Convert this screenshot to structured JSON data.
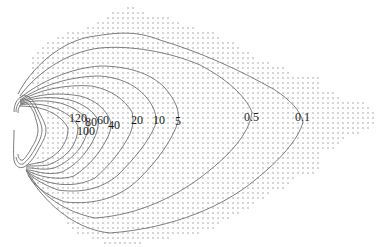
{
  "figure": {
    "dot_color": "#8a8a8a",
    "line_color": "#6e6e6e",
    "dot_spacing": 5
  },
  "contour_labels": [
    {
      "id": "120",
      "text": "120",
      "x": 69,
      "y": 112
    },
    {
      "id": "100",
      "text": "100",
      "x": 77,
      "y": 125
    },
    {
      "id": "80",
      "text": "80",
      "x": 85,
      "y": 116
    },
    {
      "id": "60",
      "text": "60",
      "x": 97,
      "y": 114
    },
    {
      "id": "40",
      "text": "40",
      "x": 108,
      "y": 119
    },
    {
      "id": "20",
      "text": "20",
      "x": 131,
      "y": 114
    },
    {
      "id": "10",
      "text": "10",
      "x": 153,
      "y": 114
    },
    {
      "id": "5",
      "text": "5",
      "x": 175,
      "y": 115
    },
    {
      "id": "0.5",
      "text": "0.5",
      "x": 244,
      "y": 111
    },
    {
      "id": "0.1",
      "text": "0.1",
      "x": 295,
      "y": 111
    }
  ],
  "grid_rows": [
    [
      8,
      128,
      133
    ],
    [
      13,
      113,
      143
    ],
    [
      18,
      108,
      168
    ],
    [
      23,
      98,
      178
    ],
    [
      28,
      88,
      193
    ],
    [
      33,
      68,
      213
    ],
    [
      38,
      58,
      218
    ],
    [
      43,
      48,
      233
    ],
    [
      48,
      43,
      238
    ],
    [
      53,
      38,
      248
    ],
    [
      58,
      33,
      253
    ],
    [
      63,
      33,
      268
    ],
    [
      68,
      33,
      283
    ],
    [
      73,
      33,
      288
    ],
    [
      78,
      33,
      318
    ],
    [
      83,
      33,
      318
    ],
    [
      88,
      38,
      318
    ],
    [
      93,
      43,
      333
    ],
    [
      98,
      48,
      338
    ],
    [
      103,
      48,
      363
    ],
    [
      108,
      48,
      368
    ],
    [
      113,
      48,
      373
    ],
    [
      118,
      48,
      373
    ],
    [
      123,
      48,
      373
    ],
    [
      128,
      48,
      368
    ],
    [
      133,
      48,
      358
    ],
    [
      138,
      48,
      343
    ],
    [
      143,
      48,
      338
    ],
    [
      148,
      43,
      333
    ],
    [
      153,
      43,
      318
    ],
    [
      158,
      38,
      318
    ],
    [
      163,
      38,
      318
    ],
    [
      168,
      33,
      318
    ],
    [
      173,
      33,
      313
    ],
    [
      178,
      33,
      293
    ],
    [
      183,
      38,
      288
    ],
    [
      188,
      43,
      283
    ],
    [
      193,
      48,
      268
    ],
    [
      198,
      53,
      263
    ],
    [
      203,
      58,
      253
    ],
    [
      208,
      58,
      248
    ],
    [
      213,
      63,
      238
    ],
    [
      218,
      68,
      228
    ],
    [
      223,
      68,
      218
    ],
    [
      228,
      73,
      213
    ],
    [
      233,
      78,
      198
    ],
    [
      238,
      93,
      168
    ],
    [
      243,
      105,
      143
    ]
  ],
  "contours": [
    {
      "level": "0.1",
      "d": "M18,94 C30,70 60,40 95,36 C115,33 135,30 160,40 C200,52 240,70 275,90 C290,100 300,110 303,122 C298,140 280,160 255,180 C225,205 175,228 110,233 C80,230 50,210 28,175"
    },
    {
      "level": "0.5",
      "d": "M20,96 C35,75 65,52 100,48 C130,45 170,52 200,65 C225,78 245,95 252,112 C250,130 235,150 210,170 C180,195 140,215 95,218 C65,212 40,195 28,172"
    },
    {
      "level": "5",
      "d": "M20,98 C40,82 70,68 100,66 C125,66 150,72 165,88 C175,100 180,110 178,122 C172,140 158,160 140,178 C120,198 95,205 65,202 C45,195 32,185 26,170"
    },
    {
      "level": "10",
      "d": "M20,100 C40,86 70,76 100,76 C125,78 140,88 150,102 C156,112 157,118 155,126 C148,142 135,158 118,175 C100,190 80,193 58,190 C42,184 32,178 26,170"
    },
    {
      "level": "20",
      "d": "M20,101 C38,90 65,84 92,86 C112,90 125,100 132,112 C134,120 133,126 130,134 C122,150 110,165 95,178 C80,186 62,186 48,182 C36,178 30,174 26,170"
    },
    {
      "level": "40",
      "d": "M20,102 C36,94 58,92 80,96 C96,100 106,110 110,120 C112,128 110,134 104,144 C96,158 86,168 74,176 C62,180 48,178 38,175 C32,173 28,171 26,170"
    },
    {
      "level": "60",
      "d": "M20,103 C34,97 52,96 70,100 C84,104 94,112 98,120 C99,128 96,136 90,146 C82,158 74,166 62,172 C52,175 42,173 34,171 C30,170 27,170 26,169"
    },
    {
      "level": "80",
      "d": "M20,104 C32,100 46,100 60,103 C74,107 84,114 88,122 C89,130 86,138 80,148 C72,158 64,164 54,168 C46,170 38,169 32,168 C29,168 27,168 26,168"
    },
    {
      "level": "100",
      "d": "M20,105 C30,103 42,104 52,107 C64,111 74,118 78,126 C78,134 76,142 70,150 C63,158 56,162 48,165 C40,166 34,166 30,166 C28,166 27,167 26,167"
    },
    {
      "level": "120",
      "d": "M19,106 C28,106 38,107 46,110 C56,114 64,120 68,128 C68,136 66,142 60,150 C54,156 48,160 42,162 C36,163 32,164 28,165 C27,165 26,166 26,166"
    },
    {
      "level": "source-outer",
      "d": "M14,112 C14,104 17,99 22,96 C28,94 34,100 38,110 C42,118 46,124 46,130 C46,137 42,143 38,150 C34,158 29,164 24,167 C19,169 15,166 14,160 C13,152 14,140 14,130"
    },
    {
      "level": "source-mid",
      "d": "M16,112 C16,106 19,101 23,99 C28,98 33,104 36,112 C39,119 42,125 42,130 C42,136 39,142 35,149 C31,156 27,161 23,164 C19,165 17,162 16,157"
    },
    {
      "level": "source-inner",
      "d": "M18,113 C18,108 20,104 24,103 C28,102 31,107 34,113 C36,120 38,125 38,130 C38,135 36,141 32,147 C29,153 26,157 23,160 C20,161 18,158 18,154"
    }
  ]
}
